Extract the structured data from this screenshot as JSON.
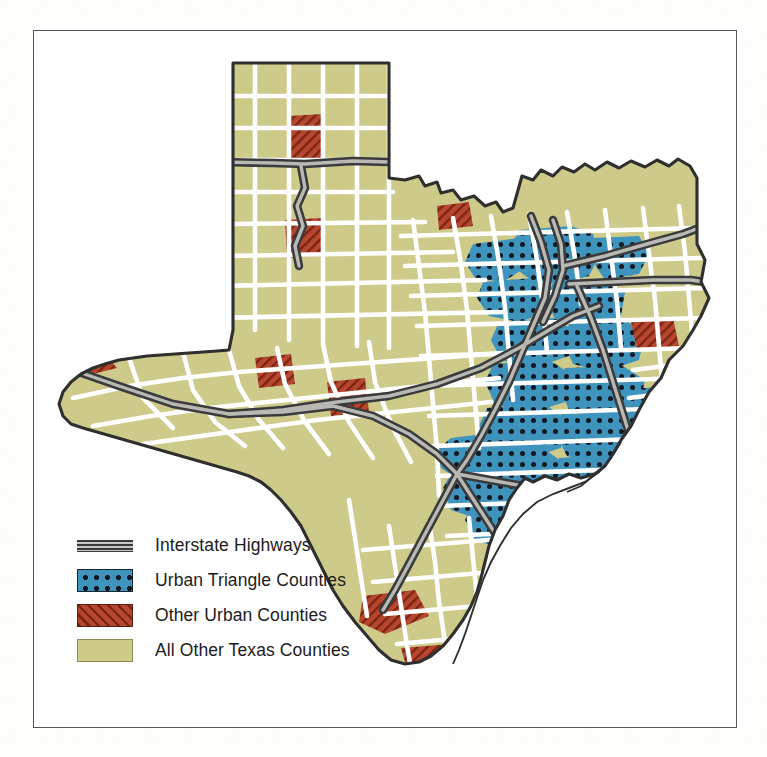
{
  "figure": {
    "kind": "thematic-county-map",
    "subject": "Texas counties",
    "frame_border_color": "#55565a",
    "page_background": "#ffffff"
  },
  "legend": {
    "items": [
      {
        "key": "interstate-highways",
        "label": "Interstate Highways",
        "symbol": "highway-band",
        "color": "#3b3b3d",
        "fill_color": "#c9c9c6"
      },
      {
        "key": "urban-triangle-counties",
        "label": "Urban Triangle Counties",
        "symbol": "blue-dotted-swatch",
        "color": "#3f94bd",
        "pattern_color": "#111820",
        "outline_color": "#15252e"
      },
      {
        "key": "other-urban-counties",
        "label": "Other Urban Counties",
        "symbol": "red-hatched-swatch",
        "color": "#b6462e",
        "pattern_color": "#7a2414",
        "outline_color": "#5d1c12"
      },
      {
        "key": "all-other-texas-counties",
        "label": "All Other Texas Counties",
        "symbol": "olive-solid-swatch",
        "color": "#cdca8a",
        "outline_color": "#8e8b55"
      }
    ]
  },
  "map": {
    "state_outline_color": "#2f2f2f",
    "county_border_color": "#ffffff",
    "base_fill": "#cdca8a",
    "urban_triangle_fill": "#3f94bd",
    "other_urban_fill": "#b6462e",
    "highway_casing": "#3b3b3d",
    "highway_core": "#b9b9b4",
    "water_fill": "#ffffff"
  }
}
